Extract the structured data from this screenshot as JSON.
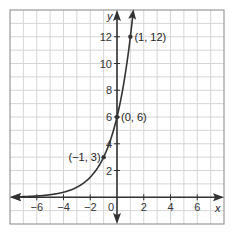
{
  "chart_data": {
    "type": "line",
    "title": "",
    "function": "y = 6 * 2^x",
    "xlabel": "x",
    "ylabel": "y",
    "xlim": [
      -8,
      8
    ],
    "ylim": [
      -2,
      14
    ],
    "grid": true,
    "grid_step": 1,
    "x_ticks": [
      -6,
      -4,
      -2,
      0,
      2,
      4,
      6
    ],
    "y_ticks": [
      2,
      4,
      6,
      8,
      10,
      12
    ],
    "x_tick_labels": [
      "−6",
      "−4",
      "−2",
      "0",
      "2",
      "4",
      "6"
    ],
    "y_tick_labels": [
      "2",
      "4",
      "6",
      "8",
      "10",
      "12"
    ],
    "points": [
      {
        "x": -1,
        "y": 3,
        "label": "(−1, 3)"
      },
      {
        "x": 0,
        "y": 6,
        "label": "(0, 6)"
      },
      {
        "x": 1,
        "y": 12,
        "label": "(1, 12)"
      }
    ],
    "legend": null
  },
  "colors": {
    "grid": "#d6d6d6",
    "border": "#9a9a9a",
    "axis": "#333333",
    "curve": "#333333"
  }
}
